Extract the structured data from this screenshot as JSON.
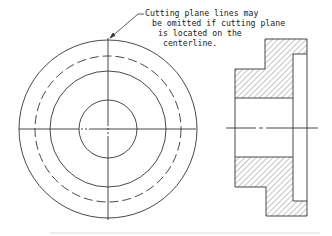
{
  "diagram": {
    "type": "engineering-drawing",
    "annotation": {
      "lines": [
        "Cutting plane lines may",
        "be omitted if cutting plane",
        "is located on the",
        "centerline."
      ]
    },
    "views": [
      {
        "name": "front-view",
        "circles": [
          {
            "role": "outer-diameter",
            "style": "solid"
          },
          {
            "role": "bolt-circle",
            "style": "dashed"
          },
          {
            "role": "hub-diameter",
            "style": "solid"
          },
          {
            "role": "bore",
            "style": "solid"
          }
        ],
        "centerlines": [
          "horizontal",
          "vertical"
        ]
      },
      {
        "name": "section-view",
        "hatching": "diagonal section lining",
        "centerline": "horizontal"
      }
    ],
    "colors": {
      "line": "#333333",
      "hatch": "#555555",
      "background": "#ffffff"
    }
  }
}
